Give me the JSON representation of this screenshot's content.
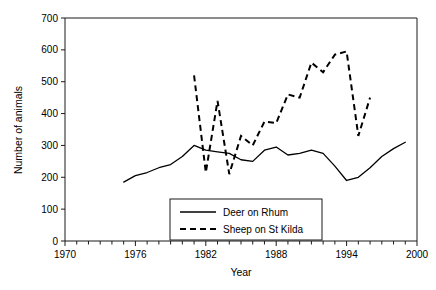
{
  "chart_data": {
    "type": "line",
    "title": "",
    "xlabel": "Year",
    "ylabel": "Number of animals",
    "xlim": [
      1970,
      2000
    ],
    "ylim": [
      0,
      700
    ],
    "x_ticks_major": [
      1970,
      1976,
      1982,
      1988,
      1994,
      2000
    ],
    "x_tick_labels": [
      "1970",
      "1976",
      "1982",
      "1988",
      "1994",
      "2000"
    ],
    "x_minor_tick_step": 1,
    "y_ticks": [
      0,
      100,
      200,
      300,
      400,
      500,
      600,
      700
    ],
    "y_tick_labels": [
      "0",
      "100",
      "200",
      "300",
      "400",
      "500",
      "600",
      "700"
    ],
    "grid": false,
    "legend_position": "lower center",
    "series": [
      {
        "name": "Deer on Rhum",
        "style": "solid",
        "color": "#000000",
        "x": [
          1975,
          1976,
          1977,
          1978,
          1979,
          1980,
          1981,
          1982,
          1983,
          1984,
          1985,
          1986,
          1987,
          1988,
          1989,
          1990,
          1991,
          1992,
          1993,
          1994,
          1995,
          1996,
          1997,
          1998,
          1999
        ],
        "values": [
          185,
          205,
          215,
          230,
          240,
          265,
          300,
          285,
          280,
          275,
          255,
          250,
          285,
          295,
          270,
          275,
          285,
          275,
          235,
          190,
          200,
          230,
          265,
          290,
          310
        ]
      },
      {
        "name": "Sheep on St Kilda",
        "style": "dashed",
        "color": "#000000",
        "x": [
          1981,
          1982,
          1983,
          1984,
          1985,
          1986,
          1987,
          1988,
          1989,
          1990,
          1991,
          1992,
          1993,
          1994,
          1995,
          1996
        ],
        "values": [
          520,
          215,
          440,
          210,
          330,
          300,
          375,
          370,
          460,
          450,
          560,
          530,
          585,
          595,
          330,
          450
        ]
      }
    ],
    "legend_entries": [
      {
        "label": "Deer on Rhum",
        "style": "solid"
      },
      {
        "label": "Sheep on St Kilda",
        "style": "dashed"
      }
    ]
  }
}
